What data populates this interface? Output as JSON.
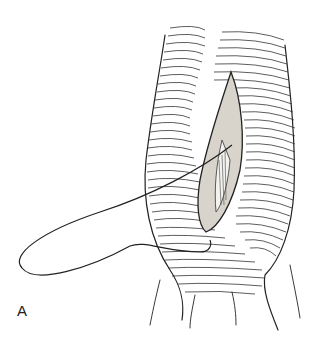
{
  "figure": {
    "panel_label": "A",
    "colors": {
      "ink": "#222222",
      "background": "#ffffff",
      "wound_fill": "#d8d4cc"
    }
  }
}
